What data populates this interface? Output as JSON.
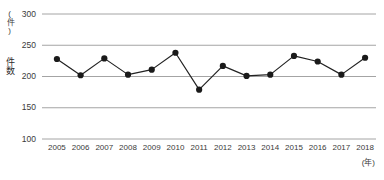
{
  "chart_data": {
    "type": "line",
    "title": "",
    "xlabel": "(年)",
    "ylabel": "件数",
    "yunit": "(件)",
    "categories": [
      "2005",
      "2006",
      "2007",
      "2008",
      "2009",
      "2010",
      "2011",
      "2012",
      "2013",
      "2014",
      "2015",
      "2016",
      "2017",
      "2018"
    ],
    "values": [
      228,
      202,
      229,
      203,
      211,
      238,
      179,
      217,
      201,
      203,
      233,
      224,
      203,
      230
    ],
    "series": [
      {
        "name": "件数",
        "values": [
          228,
          202,
          229,
          203,
          211,
          238,
          179,
          217,
          201,
          203,
          233,
          224,
          203,
          230
        ]
      }
    ],
    "ylim": [
      100,
      300
    ],
    "yticks": [
      100,
      150,
      200,
      250,
      300
    ],
    "ytick_labels": [
      "100",
      "150",
      "200",
      "250",
      "300"
    ],
    "grid": true,
    "grid_axis": "y",
    "legend": false,
    "legend_position": "none",
    "marker": "circle",
    "line_color": "#222222",
    "marker_color": "#1a1a1a",
    "grid_color": "#9a9a9a",
    "text_color": "#3a3a3a"
  }
}
